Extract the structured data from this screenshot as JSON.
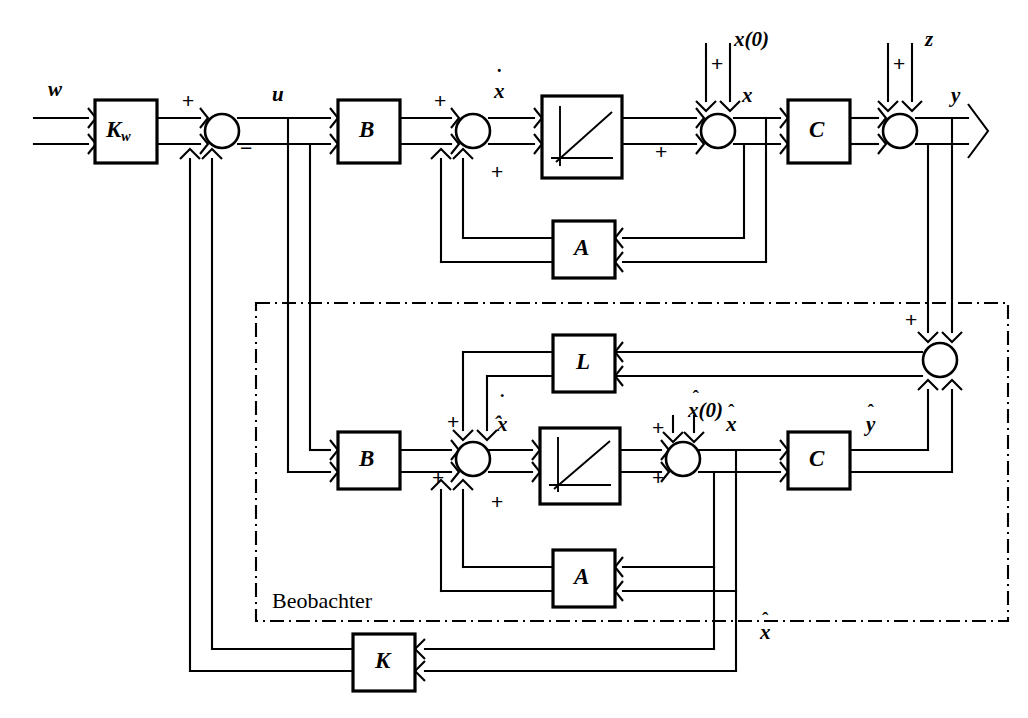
{
  "diagram": {
    "region_label": "Beobachter",
    "line_color": "#000000",
    "background": "#ffffff"
  },
  "blocks": [
    {
      "id": "kw",
      "label": "K",
      "sub": "w",
      "x": 95,
      "y": 100,
      "w": 62,
      "h": 63
    },
    {
      "id": "b_plant",
      "label": "B",
      "sub": "",
      "x": 338,
      "y": 100,
      "w": 62,
      "h": 63
    },
    {
      "id": "int_plant",
      "label": "",
      "sub": "",
      "x": 542,
      "y": 96,
      "w": 80,
      "h": 82
    },
    {
      "id": "c_plant",
      "label": "C",
      "sub": "",
      "x": 788,
      "y": 100,
      "w": 62,
      "h": 63
    },
    {
      "id": "a_plant",
      "label": "A",
      "sub": "",
      "x": 553,
      "y": 221,
      "w": 62,
      "h": 57
    },
    {
      "id": "l_obs",
      "label": "L",
      "sub": "",
      "x": 553,
      "y": 335,
      "w": 62,
      "h": 57
    },
    {
      "id": "b_obs",
      "label": "B",
      "sub": "",
      "x": 338,
      "y": 432,
      "w": 62,
      "h": 57
    },
    {
      "id": "int_obs",
      "label": "",
      "sub": "",
      "x": 540,
      "y": 428,
      "w": 80,
      "h": 76
    },
    {
      "id": "c_obs",
      "label": "C",
      "sub": "",
      "x": 788,
      "y": 432,
      "w": 62,
      "h": 57
    },
    {
      "id": "a_obs",
      "label": "A",
      "sub": "",
      "x": 553,
      "y": 550,
      "w": 62,
      "h": 57
    },
    {
      "id": "k_fb",
      "label": "K",
      "sub": "",
      "x": 353,
      "y": 634,
      "w": 62,
      "h": 57
    }
  ],
  "junctions": [
    {
      "id": "sum_u",
      "cx": 222,
      "cy": 131
    },
    {
      "id": "sum_xdot",
      "cx": 473,
      "cy": 131
    },
    {
      "id": "sum_x",
      "cx": 718,
      "cy": 131
    },
    {
      "id": "sum_y",
      "cx": 900,
      "cy": 131
    },
    {
      "id": "sum_err",
      "cx": 940,
      "cy": 360
    },
    {
      "id": "sum_xhdot",
      "cx": 473,
      "cy": 459
    },
    {
      "id": "sum_xhat",
      "cx": 683,
      "cy": 459
    }
  ],
  "signal_labels": [
    {
      "id": "w",
      "text": "w",
      "kind": "plain",
      "x": 48,
      "y": 77
    },
    {
      "id": "u",
      "text": "u",
      "kind": "plain",
      "x": 272,
      "y": 82
    },
    {
      "id": "xdot",
      "text": "x",
      "kind": "dot",
      "x": 494,
      "y": 79
    },
    {
      "id": "x",
      "text": "x",
      "kind": "plain",
      "x": 742,
      "y": 83
    },
    {
      "id": "x0",
      "text": "x(0)",
      "kind": "plain",
      "x": 734,
      "y": 27
    },
    {
      "id": "z",
      "text": "z",
      "kind": "plain",
      "x": 925,
      "y": 27
    },
    {
      "id": "y",
      "text": "y",
      "kind": "plain",
      "x": 951,
      "y": 83
    },
    {
      "id": "xhdot",
      "text": "x",
      "kind": "dothat",
      "x": 497,
      "y": 409
    },
    {
      "id": "xhat0",
      "text": "x(0)",
      "kind": "hat",
      "x": 688,
      "y": 398
    },
    {
      "id": "xhat",
      "text": "x",
      "kind": "hat",
      "x": 726,
      "y": 412
    },
    {
      "id": "yhat",
      "text": "y",
      "kind": "hat",
      "x": 866,
      "y": 412
    },
    {
      "id": "xhat_b",
      "text": "x",
      "kind": "hat",
      "x": 760,
      "y": 620
    }
  ],
  "sign_labels": [
    {
      "id": "plus_kw_out",
      "text": "+",
      "x": 182,
      "y": 96
    },
    {
      "id": "minus_sum_u",
      "text": "−",
      "x": 240,
      "y": 143
    },
    {
      "id": "plus_b_out",
      "text": "+",
      "x": 434,
      "y": 96
    },
    {
      "id": "plus_a_fb",
      "text": "+",
      "x": 491,
      "y": 158
    },
    {
      "id": "plus_x0",
      "text": "+",
      "x": 711,
      "y": 54
    },
    {
      "id": "plus_int_out",
      "text": "+",
      "x": 655,
      "y": 143
    },
    {
      "id": "plus_z",
      "text": "+",
      "x": 893,
      "y": 54
    },
    {
      "id": "plus_err_top",
      "text": "+",
      "x": 905,
      "y": 313
    },
    {
      "id": "minus_err",
      "text": "−",
      "x": 905,
      "y": 372
    },
    {
      "id": "plus_l_in",
      "text": "+",
      "x": 447,
      "y": 414
    },
    {
      "id": "plus_b_obs",
      "text": "+",
      "x": 432,
      "y": 470
    },
    {
      "id": "plus_a_obs",
      "text": "+",
      "x": 491,
      "y": 488
    },
    {
      "id": "plus_xh0",
      "text": "+",
      "x": 657,
      "y": 420
    },
    {
      "id": "plus_int_obs",
      "text": "+",
      "x": 652,
      "y": 470
    }
  ]
}
